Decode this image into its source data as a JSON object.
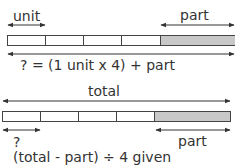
{
  "diagram1": {
    "unit_label": "unit",
    "part_label": "part",
    "formula": "? = (1 unit x 4) + part",
    "unit_count": 4,
    "shaded_color": "#c8c8c8"
  },
  "diagram2": {
    "total_label": "total",
    "unknown_label": "?",
    "part_label": "part",
    "formula": "(total - part) ÷ 4 given",
    "unit_count": 4,
    "shaded_color": "#c8c8c8"
  }
}
